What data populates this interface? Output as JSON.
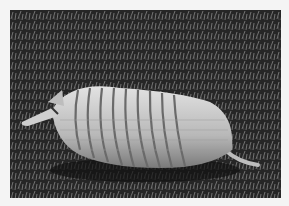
{
  "image": {
    "subject": "armadillo",
    "description": "Black-and-white photograph of an armadillo walking on grass",
    "style": "grayscale",
    "colors": {
      "border": "#f4f4f4",
      "grass_dark": "#1e1e1e",
      "grass_light": "#8a8a8a",
      "shell": "#cfcfcf",
      "shell_shadow": "#6e6e6e"
    }
  }
}
